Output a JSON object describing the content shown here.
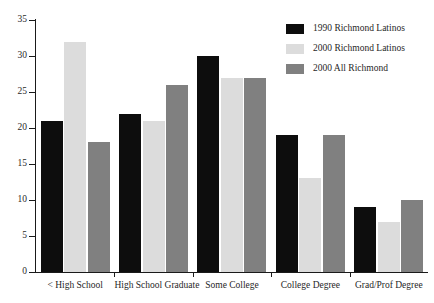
{
  "chart_data": {
    "type": "bar",
    "title": "",
    "xlabel": "",
    "ylabel": "",
    "ylim": [
      0,
      35
    ],
    "yticks": [
      0,
      5,
      10,
      15,
      20,
      25,
      30,
      35
    ],
    "grid": false,
    "legend_position": "top-right",
    "categories": [
      "< High School",
      "High School Graduate",
      "Some College",
      "College Degree",
      "Grad/Prof Degree"
    ],
    "series": [
      {
        "name": "1990 Richmond Latinos",
        "color": "#0d0d0d",
        "values": [
          21,
          22,
          30,
          19,
          9
        ]
      },
      {
        "name": "2000 Richmond Latinos",
        "color": "#dcdcdc",
        "values": [
          32,
          21,
          27,
          13,
          7
        ]
      },
      {
        "name": "2000 All Richmond",
        "color": "#808080",
        "values": [
          18,
          26,
          27,
          19,
          10
        ]
      }
    ]
  }
}
